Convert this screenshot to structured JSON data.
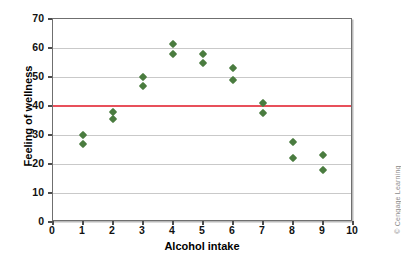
{
  "chart_data": {
    "type": "scatter",
    "title": "",
    "xlabel": "Alcohol intake",
    "ylabel": "Feeling of wellness",
    "xlim": [
      0,
      10
    ],
    "ylim": [
      0,
      70
    ],
    "xticks": [
      0,
      1,
      2,
      3,
      4,
      5,
      6,
      7,
      8,
      9,
      10
    ],
    "yticks": [
      0,
      10,
      20,
      30,
      40,
      50,
      60,
      70
    ],
    "grid": "horizontal",
    "legend": "none",
    "marker_shape": "diamond",
    "marker_color": "#4a7c3f",
    "series": [
      {
        "name": "Feeling of wellness",
        "points": [
          {
            "x": 1,
            "y": 30
          },
          {
            "x": 1,
            "y": 27
          },
          {
            "x": 2,
            "y": 38
          },
          {
            "x": 2,
            "y": 35.5
          },
          {
            "x": 3,
            "y": 50
          },
          {
            "x": 3,
            "y": 47
          },
          {
            "x": 4,
            "y": 61.5
          },
          {
            "x": 4,
            "y": 58
          },
          {
            "x": 5,
            "y": 58
          },
          {
            "x": 5,
            "y": 55
          },
          {
            "x": 6,
            "y": 53
          },
          {
            "x": 6,
            "y": 49
          },
          {
            "x": 7,
            "y": 41
          },
          {
            "x": 7,
            "y": 37.5
          },
          {
            "x": 8,
            "y": 27.5
          },
          {
            "x": 8,
            "y": 22
          },
          {
            "x": 9,
            "y": 23
          },
          {
            "x": 9,
            "y": 18
          }
        ]
      }
    ],
    "reference_line": {
      "orientation": "horizontal",
      "value": 40,
      "color": "#e8505b",
      "label": ""
    },
    "annotations": [
      {
        "name": "credit",
        "text": "© Cengage Learning"
      }
    ]
  },
  "credit": {
    "text": "© Cengage Learning"
  }
}
